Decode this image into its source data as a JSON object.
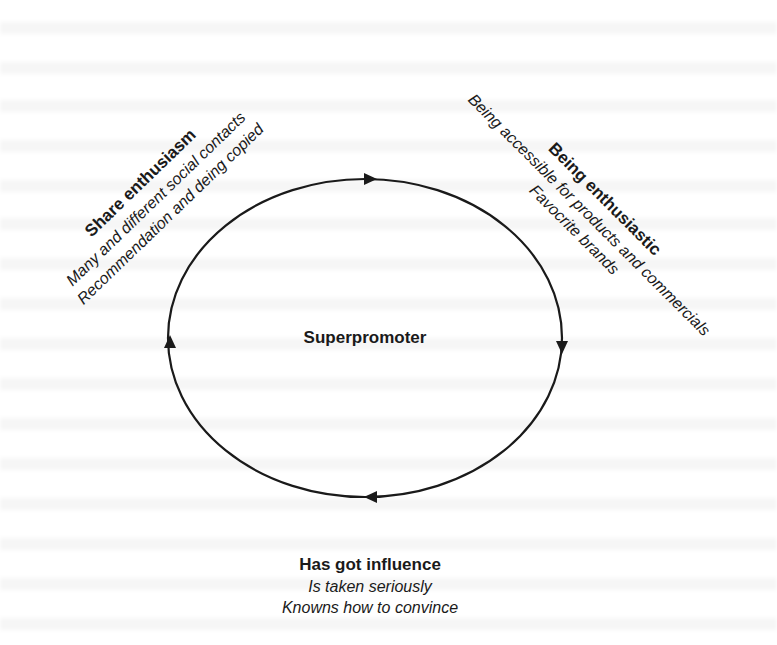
{
  "diagram": {
    "center": {
      "label": "Superpromoter"
    },
    "cycle": {
      "shape": "ellipse",
      "direction": "clockwise",
      "arrows": [
        "top-right",
        "right-down",
        "bottom-left",
        "left-up"
      ],
      "stroke_color": "#1a1a1a"
    },
    "nodes": {
      "share": {
        "title": "Share enthusiasm",
        "lines": [
          "Many and different social contacts",
          "Recommendation and deing copied"
        ]
      },
      "enthusiastic": {
        "title": "Being enthusiastic",
        "lines": [
          "Being accessible for products and commercials",
          "Favocrite brands"
        ]
      },
      "influence": {
        "title": "Has got influence",
        "lines": [
          "Is taken seriously",
          "Knowns how to convince"
        ]
      }
    }
  }
}
